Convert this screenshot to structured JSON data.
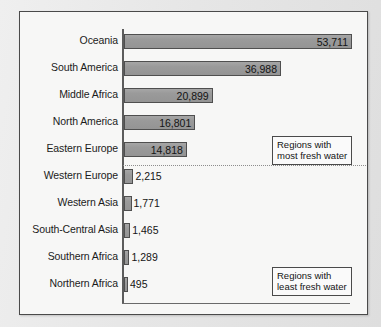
{
  "chart_data": {
    "type": "bar",
    "orientation": "horizontal",
    "title": "",
    "subtitle": "",
    "xlabel": "",
    "ylabel": "",
    "categories": [
      "Oceania",
      "South America",
      "Middle Africa",
      "North America",
      "Eastern Europe",
      "Western Europe",
      "Western Asia",
      "South-Central Asia",
      "Southern Africa",
      "Northern Africa"
    ],
    "values": [
      53711,
      36988,
      20899,
      16801,
      14818,
      2215,
      1771,
      1465,
      1289,
      495
    ],
    "value_labels": [
      "53,711",
      "36,988",
      "20,899",
      "16,801",
      "14,818",
      "2,215",
      "1,771",
      "1,465",
      "1,289",
      "495"
    ],
    "xlim": [
      0,
      53711
    ],
    "grid": false,
    "legend": false,
    "bar_color": "#9a9a9a",
    "bar_edge_color": "#4f4f4f",
    "background_color": "#f7f7f6",
    "axis_color": "#5c5c5c",
    "divider_after_index": 4,
    "divider_style": "dotted",
    "annotations": [
      {
        "name": "most-fresh-water",
        "line1": "Regions with",
        "line2": "most fresh water"
      },
      {
        "name": "least-fresh-water",
        "line1": "Regions with",
        "line2": "least fresh water"
      }
    ]
  },
  "rows": [
    {
      "label": "Oceania",
      "value_label": "53,711",
      "value": 53711,
      "inside": true
    },
    {
      "label": "South America",
      "value_label": "36,988",
      "value": 36988,
      "inside": true
    },
    {
      "label": "Middle Africa",
      "value_label": "20,899",
      "value": 20899,
      "inside": true
    },
    {
      "label": "North America",
      "value_label": "16,801",
      "value": 16801,
      "inside": true
    },
    {
      "label": "Eastern Europe",
      "value_label": "14,818",
      "value": 14818,
      "inside": true
    },
    {
      "label": "Western Europe",
      "value_label": "2,215",
      "value": 2215,
      "inside": false
    },
    {
      "label": "Western Asia",
      "value_label": "1,771",
      "value": 1771,
      "inside": false
    },
    {
      "label": "South-Central Asia",
      "value_label": "1,465",
      "value": 1465,
      "inside": false
    },
    {
      "label": "Southern Africa",
      "value_label": "1,289",
      "value": 1289,
      "inside": false
    },
    {
      "label": "Northern Africa",
      "value_label": "495",
      "value": 495,
      "inside": false
    }
  ],
  "callouts": {
    "most": {
      "line1": "Regions with",
      "line2": "most fresh water"
    },
    "least": {
      "line1": "Regions with",
      "line2": "least fresh water"
    }
  }
}
